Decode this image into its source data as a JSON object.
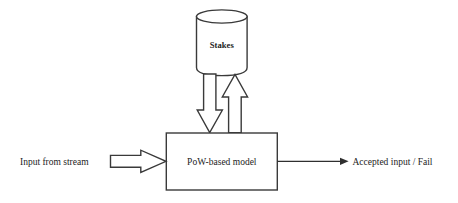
{
  "diagram": {
    "background_color": "#ffffff",
    "line_color": "#3a3a3a",
    "text_color": "#1c1c1c",
    "nodes": {
      "datastore": {
        "label": "Stakes",
        "shape": "cylinder"
      },
      "process": {
        "label": "PoW-based model",
        "shape": "rectangle"
      }
    },
    "labels": {
      "input": "Input from stream",
      "output": "Accepted input / Fail"
    },
    "connectors": {
      "input_arrow": "block-arrow-right",
      "store_write_arrow": "block-arrow-down",
      "store_read_arrow": "block-arrow-up",
      "output_arrow": "line-arrow-right"
    }
  }
}
